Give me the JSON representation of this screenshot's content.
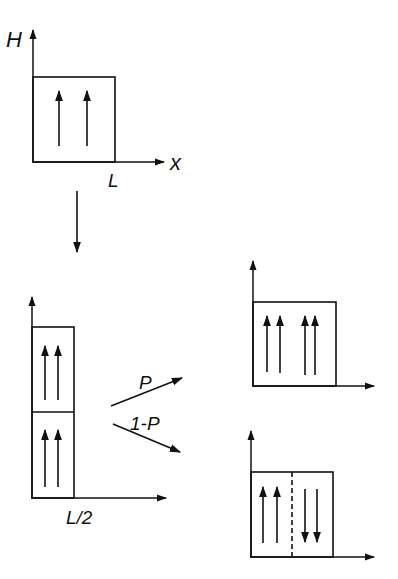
{
  "diagram": {
    "colors": {
      "ink": "#111111",
      "background": "#ffffff"
    },
    "initial_state": {
      "y_axis_label": "H",
      "x_axis_label": "x",
      "x_tick_label": "L",
      "arrows": [
        "up",
        "up"
      ]
    },
    "transition_arrow": "down",
    "split_state": {
      "x_tick_label": "L/2",
      "upper_block_arrows": [
        "up",
        "up"
      ],
      "lower_block_arrows": [
        "up",
        "up"
      ]
    },
    "branches": [
      {
        "probability_label": "P",
        "result": "aligned",
        "arrows": [
          "up",
          "up",
          "up",
          "up"
        ]
      },
      {
        "probability_label": "1-P",
        "result": "anti-aligned with dashed domain boundary",
        "arrows": [
          "up",
          "up",
          "down",
          "down"
        ]
      }
    ]
  }
}
